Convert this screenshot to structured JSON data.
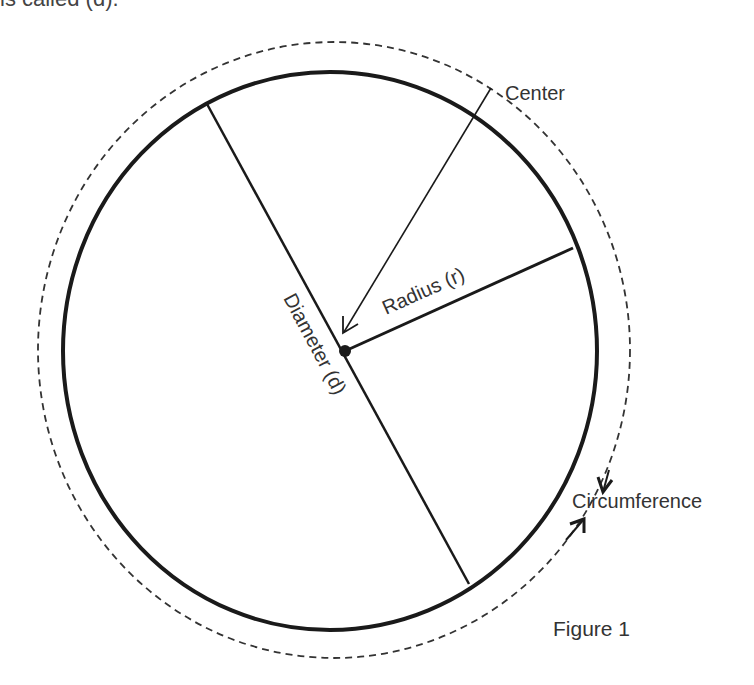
{
  "header": {
    "partial_text": "is called (d)."
  },
  "diagram": {
    "title": "Figure 1",
    "labels": {
      "center": "Center",
      "radius": "Radius (r)",
      "diameter": "Diameter (d)",
      "circumference": "Circumference"
    },
    "colors": {
      "stroke": "#1a1a1a",
      "text": "#333333",
      "background": "#ffffff"
    }
  }
}
